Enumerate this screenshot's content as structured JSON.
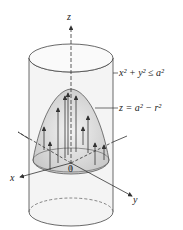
{
  "diagram": {
    "type": "3d-surface-in-cylinder",
    "axes": {
      "z_label": "z",
      "x_label": "x",
      "y_label": "y",
      "origin_label": "0"
    },
    "annotations": {
      "cylinder_region": "x² + y² ≤ a²",
      "paraboloid_surface": "z = a² − r²"
    },
    "colors": {
      "stroke": "#333333",
      "shade": "#cfcfcf",
      "background": "#ffffff"
    }
  }
}
